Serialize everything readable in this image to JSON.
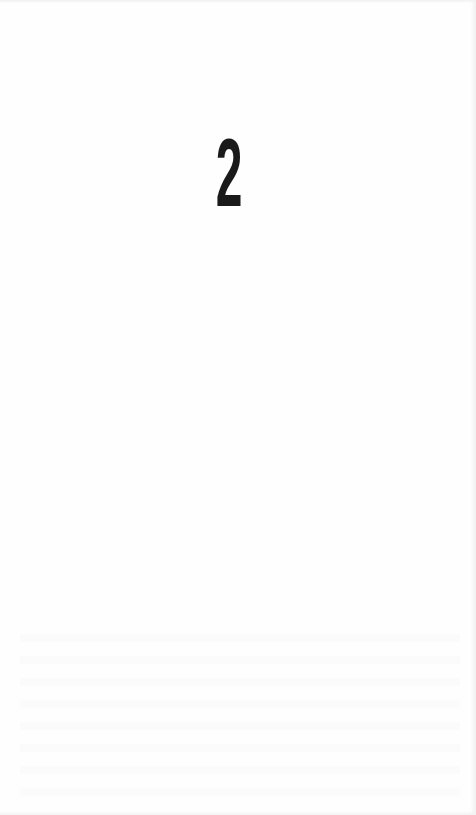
{
  "page": {
    "chapter_number": "2",
    "background_color": "#fefefe",
    "text_color": "#1a1a1a"
  }
}
